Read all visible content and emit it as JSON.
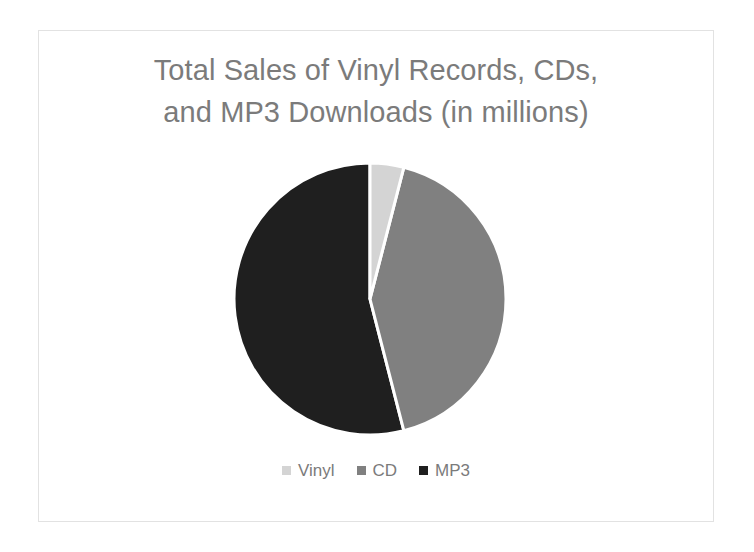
{
  "chart_data": {
    "type": "pie",
    "title": "Total Sales of Vinyl Records, CDs, and MP3 Downloads (in millions)",
    "title_lines": [
      "Total Sales of Vinyl Records, CDs,",
      "and MP3 Downloads (in millions)"
    ],
    "categories": [
      "Vinyl",
      "CD",
      "MP3"
    ],
    "values": [
      4,
      42,
      54
    ],
    "unit": "millions",
    "slice_angles_deg": [
      14,
      150,
      196
    ],
    "colors": [
      "#d4d4d4",
      "#808080",
      "#1f1f1f"
    ],
    "slice_border_color": "#ffffff",
    "legend_position": "bottom",
    "grid": false,
    "xlabel": "",
    "ylabel": "",
    "series": [
      {
        "name": "Vinyl",
        "value": 4,
        "color": "#d4d4d4"
      },
      {
        "name": "CD",
        "value": 42,
        "color": "#808080"
      },
      {
        "name": "MP3",
        "value": 54,
        "color": "#1f1f1f"
      }
    ]
  },
  "legend": {
    "items": [
      {
        "label": "Vinyl",
        "swatch_name": "legend-swatch-vinyl"
      },
      {
        "label": "CD",
        "swatch_name": "legend-swatch-cd"
      },
      {
        "label": "MP3",
        "swatch_name": "legend-swatch-mp3"
      }
    ]
  },
  "theme": {
    "text_color": "#7b7b7b",
    "frame_border": "#e2e2e2",
    "background": "#ffffff"
  }
}
